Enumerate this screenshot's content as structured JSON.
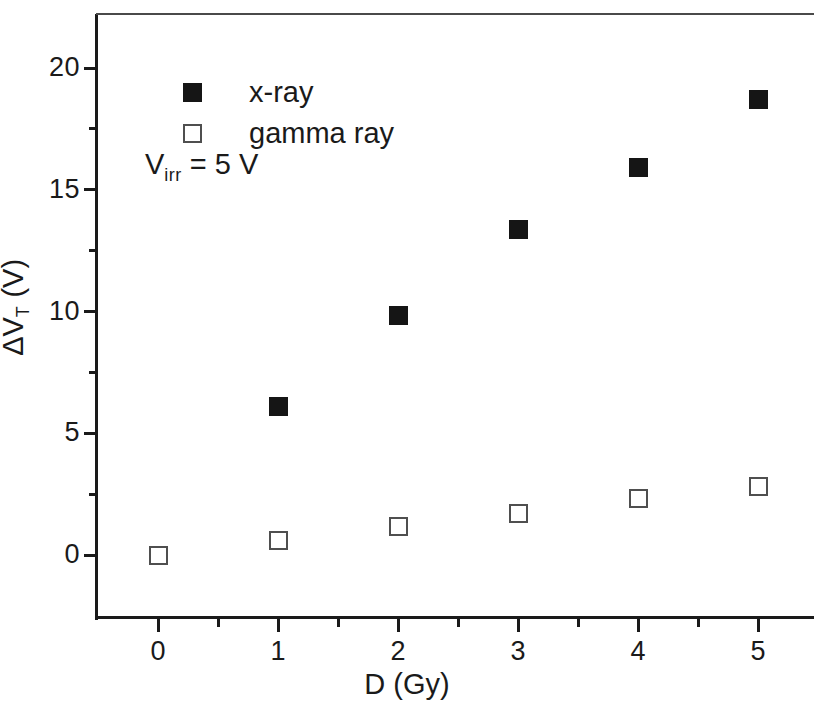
{
  "chart_data": {
    "type": "scatter",
    "title": "",
    "xlabel": "D (Gy)",
    "ylabel": "ΔV_T (V)",
    "ylabel_main": "ΔV",
    "ylabel_sub": "T",
    "ylabel_unit": " (V)",
    "xlabel_main": "D (Gy)",
    "xlim": [
      -0.35,
      5.9
    ],
    "ylim": [
      -1.6,
      22.3
    ],
    "grid": false,
    "legend_position": "upper-center-left",
    "x_major_ticks": [
      0,
      1,
      2,
      3,
      4,
      5
    ],
    "x_tick_labels": [
      "0",
      "1",
      "2",
      "3",
      "4",
      "5"
    ],
    "x_minor_ticks": [
      0.5,
      1.5,
      2.5,
      3.5,
      4.5,
      5.5
    ],
    "y_major_ticks": [
      0,
      5,
      10,
      15,
      20
    ],
    "y_tick_labels": [
      "0",
      "5",
      "10",
      "15",
      "20"
    ],
    "y_minor_ticks": [
      2.5,
      7.5,
      12.5,
      17.5
    ],
    "series": [
      {
        "name": "x-ray",
        "marker": "filled-square",
        "color": "#151515",
        "x": [
          1,
          2,
          3,
          4,
          5
        ],
        "values": [
          6.1,
          9.85,
          13.35,
          15.9,
          18.7
        ]
      },
      {
        "name": "gamma ray",
        "marker": "open-square",
        "color": "#4f4f4f",
        "x": [
          0,
          1,
          2,
          3,
          4,
          5
        ],
        "values": [
          0.0,
          0.6,
          1.15,
          1.7,
          2.3,
          2.8
        ]
      }
    ],
    "annotations": [
      {
        "text": "V_irr = 5 V",
        "main": "V",
        "sub": "irr",
        "tail": " = 5 V"
      }
    ]
  },
  "legend": {
    "items": [
      {
        "label": "x-ray",
        "marker": "filled-square"
      },
      {
        "label": "gamma ray",
        "marker": "open-square"
      }
    ]
  }
}
